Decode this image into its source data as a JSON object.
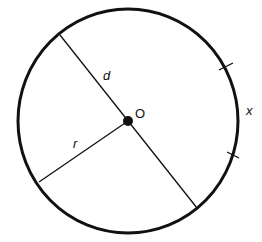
{
  "diagram": {
    "title": "",
    "colors": {
      "stroke": "#111111",
      "background": "#ffffff"
    },
    "circle": {
      "cx": 128,
      "cy": 121,
      "rx": 110,
      "ry": 112
    },
    "center_point": {
      "label": "O",
      "x": 128,
      "y": 121
    },
    "diameter": {
      "label": "d",
      "x1": 60,
      "y1": 35,
      "x2": 197,
      "y2": 208
    },
    "radius": {
      "label": "r",
      "x1": 128,
      "y1": 121,
      "x2": 39,
      "y2": 182
    },
    "arc": {
      "label": "x",
      "tick1": [
        226,
        66
      ],
      "tick2": [
        233,
        155
      ]
    }
  }
}
